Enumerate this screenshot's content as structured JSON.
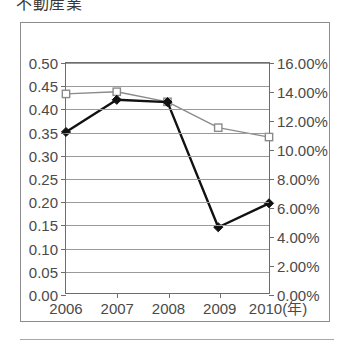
{
  "title": "不動産業",
  "chart_data": {
    "type": "line",
    "title": "不動産業",
    "xlabel": "(年)",
    "ylabel": "",
    "categories": [
      "2006",
      "2007",
      "2008",
      "2009",
      "2010"
    ],
    "x_axis_unit_label": "(年)",
    "grid": "horizontal",
    "legend": "none",
    "left_axis": {
      "ylim": [
        0.0,
        0.5
      ],
      "tick_step": 0.05,
      "tick_labels": [
        "0.00",
        "0.05",
        "0.10",
        "0.15",
        "0.20",
        "0.25",
        "0.30",
        "0.35",
        "0.40",
        "0.45",
        "0.50"
      ]
    },
    "right_axis": {
      "ylim": [
        0.0,
        16.0
      ],
      "tick_step": 2.0,
      "tick_labels": [
        "0.00%",
        "2.00%",
        "4.00%",
        "6.00%",
        "8.00%",
        "10.00%",
        "12.00%",
        "14.00%",
        "16.00%"
      ]
    },
    "series": [
      {
        "name": "diamond-series",
        "axis": "left",
        "marker": "filled-diamond",
        "line_style": "solid",
        "color": "#111111",
        "values": [
          0.35,
          0.42,
          0.415,
          0.143,
          0.195
        ]
      },
      {
        "name": "square-series",
        "axis": "right",
        "marker": "open-square",
        "line_style": "solid-thin",
        "color": "#8a8a8a",
        "values": [
          13.85,
          14.0,
          13.3,
          11.5,
          10.85
        ]
      }
    ]
  }
}
